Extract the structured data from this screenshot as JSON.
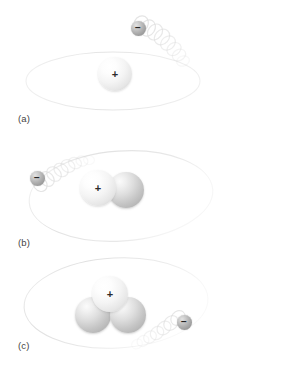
{
  "figure": {
    "width": 291,
    "height": 373,
    "background_color": "#ffffff"
  },
  "colors": {
    "proton_light": "#ffffff",
    "proton_shade": "#c9c9c9",
    "neutron_light": "#fbfbfb",
    "neutron_shade": "#a6a6a6",
    "electron_light": "#e3e3e3",
    "electron_shade": "#8d8d8d",
    "orbit_line": "#e8e8e8",
    "trail": "#d8d8d8",
    "label_text": "#444444",
    "charge_text": "#2b2b2b"
  },
  "panels": [
    {
      "id": "a",
      "label": "(a)",
      "nucleus": {
        "protons": 1,
        "neutrons": 0,
        "particles": [
          {
            "type": "proton",
            "charge": "+",
            "cx": 115,
            "cy": 74,
            "r": 17
          }
        ]
      },
      "electron": {
        "charge": "−",
        "cx": 138,
        "cy": 28,
        "r": 7.5
      },
      "orbit": {
        "cx": 113,
        "cy": 81,
        "rx": 87,
        "ry": 29
      }
    },
    {
      "id": "b",
      "label": "(b)",
      "nucleus": {
        "protons": 1,
        "neutrons": 1,
        "particles": [
          {
            "type": "proton",
            "charge": "+",
            "cx": 98,
            "cy": 188,
            "r": 18
          },
          {
            "type": "neutron",
            "charge": "",
            "cx": 126,
            "cy": 190,
            "r": 18
          }
        ]
      },
      "electron": {
        "charge": "−",
        "cx": 37,
        "cy": 178,
        "r": 7.5
      },
      "orbit": {
        "cx": 121,
        "cy": 196,
        "rx": 92,
        "ry": 45
      }
    },
    {
      "id": "c",
      "label": "(c)",
      "nucleus": {
        "protons": 1,
        "neutrons": 2,
        "particles": [
          {
            "type": "proton",
            "charge": "+",
            "cx": 110,
            "cy": 294,
            "r": 18
          },
          {
            "type": "neutron",
            "charge": "",
            "cx": 93,
            "cy": 315,
            "r": 18
          },
          {
            "type": "neutron",
            "charge": "",
            "cx": 128,
            "cy": 315,
            "r": 18
          }
        ]
      },
      "electron": {
        "charge": "−",
        "cx": 184,
        "cy": 322,
        "r": 7.5
      },
      "orbit": {
        "cx": 116,
        "cy": 303,
        "rx": 92,
        "ry": 45
      }
    }
  ],
  "labels": {
    "a": "(a)",
    "b": "(b)",
    "c": "(c)"
  },
  "label_positions": {
    "a": {
      "x": 18,
      "y": 119
    },
    "b": {
      "x": 18,
      "y": 243
    },
    "c": {
      "x": 18,
      "y": 340
    }
  },
  "charges": {
    "positive": "+",
    "negative": "−"
  }
}
